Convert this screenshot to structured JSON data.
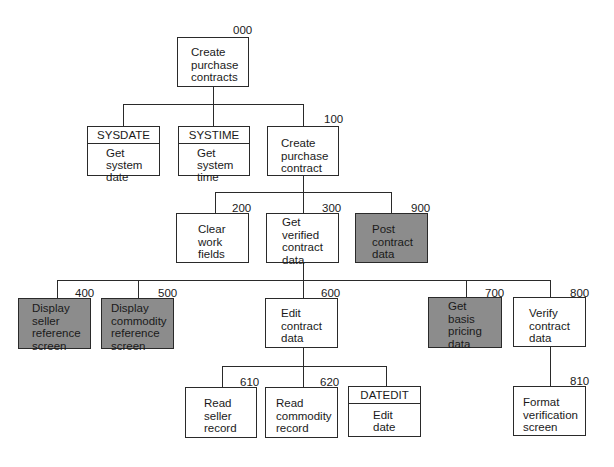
{
  "diagram": {
    "type": "structure-chart",
    "nodes": {
      "n000": {
        "id": "000",
        "label": "Create\npurchase\ncontracts"
      },
      "sysdate": {
        "header": "SYSDATE",
        "label": "Get\nsystem\ndate"
      },
      "systime": {
        "header": "SYSTIME",
        "label": "Get\nsystem\ntime"
      },
      "n100": {
        "id": "100",
        "label": "Create\npurchase\ncontract"
      },
      "n200": {
        "id": "200",
        "label": "Clear\nwork\nfields"
      },
      "n300": {
        "id": "300",
        "label": "Get\nverified\ncontract\ndata"
      },
      "n900": {
        "id": "900",
        "label": "Post\ncontract\ndata",
        "shaded": true
      },
      "n400": {
        "id": "400",
        "label": "Display\nseller\nreference\nscreen",
        "shaded": true
      },
      "n500": {
        "id": "500",
        "label": "Display\ncommodity\nreference\nscreen",
        "shaded": true
      },
      "n600": {
        "id": "600",
        "label": "Edit\ncontract\ndata"
      },
      "n700": {
        "id": "700",
        "label": "Get\nbasis\npricing\ndata",
        "shaded": true
      },
      "n800": {
        "id": "800",
        "label": "Verify\ncontract\ndata"
      },
      "n610": {
        "id": "610",
        "label": "Read\nseller\nrecord"
      },
      "n620": {
        "id": "620",
        "label": "Read\ncommodity\nrecord"
      },
      "datedit": {
        "header": "DATEDIT",
        "label": "Edit\ndate"
      },
      "n810": {
        "id": "810",
        "label": "Format\nverification\nscreen"
      }
    },
    "colors": {
      "shaded_fill": "#8c8c8c",
      "line": "#2a2a2a"
    }
  }
}
